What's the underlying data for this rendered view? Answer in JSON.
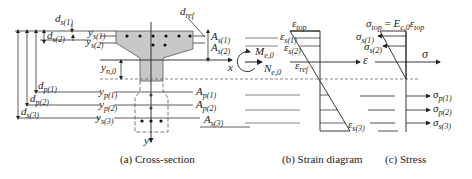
{
  "figure": {
    "panels": [
      {
        "id": "cross-section",
        "caption": "(a) Cross-section"
      },
      {
        "id": "strain",
        "caption": "(b) Strain diagram"
      },
      {
        "id": "stress",
        "caption": "(c) Stress"
      }
    ],
    "cross_section": {
      "dims_left": [
        {
          "sym": "d",
          "sub": "s(1)"
        },
        {
          "sym": "d",
          "sub": "s(2)"
        },
        {
          "sym": "d",
          "sub": "p(1)"
        },
        {
          "sym": "d",
          "sub": "p(2)"
        },
        {
          "sym": "d",
          "sub": "s(3)"
        }
      ],
      "y_labels": [
        {
          "sym": "y",
          "sub": "s(1)"
        },
        {
          "sym": "y",
          "sub": "s(2)"
        },
        {
          "sym": "y",
          "sub": "n,0"
        },
        {
          "sym": "y",
          "sub": "p(1)"
        },
        {
          "sym": "y",
          "sub": "p(2)"
        },
        {
          "sym": "y",
          "sub": "s(3)"
        }
      ],
      "area_labels": [
        {
          "sym": "A",
          "sub": "s(1)"
        },
        {
          "sym": "A",
          "sub": "s(2)"
        },
        {
          "sym": "A",
          "sub": "p(1)"
        },
        {
          "sym": "A",
          "sub": "p(2)"
        },
        {
          "sym": "A",
          "sub": "s(3)"
        }
      ],
      "d_ref": {
        "sym": "d",
        "sub": "ref"
      },
      "axis_x": "x",
      "axis_y": "y",
      "moment": {
        "sym": "M",
        "sub": "e,0"
      },
      "normal_force": {
        "sym": "N",
        "sub": "e,0"
      }
    },
    "strain": {
      "top": {
        "sym": "ε",
        "sub": "top"
      },
      "layers": [
        {
          "sym": "ε",
          "sub": "s(1)"
        },
        {
          "sym": "ε",
          "sub": "s(2)"
        },
        {
          "sym": "ε",
          "sub": "ref"
        },
        {
          "sym": "ε",
          "sub": "s(3)"
        }
      ],
      "axis": "ε"
    },
    "stress": {
      "equation": {
        "lhs_sym": "σ",
        "lhs_sub": "top",
        "eq": " = ",
        "E": "E",
        "E_sub": "c,0",
        "eps": "ε",
        "eps_sub": "top"
      },
      "layers": [
        {
          "sym": "σ",
          "sub": "s(1)"
        },
        {
          "sym": "σ",
          "sub": "s(2)"
        },
        {
          "sym": "σ",
          "sub": "p(1)"
        },
        {
          "sym": "σ",
          "sub": "p(2)"
        },
        {
          "sym": "σ",
          "sub": "s(3)"
        }
      ],
      "axis": "σ"
    },
    "colors": {
      "fill": "#c8c8c8",
      "line": "#333333"
    }
  }
}
